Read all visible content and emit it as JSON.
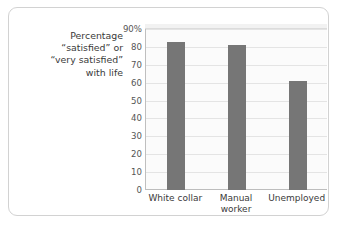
{
  "caption": {
    "lines": [
      "Percentage",
      "“satisfied” or",
      "“very satisfied”",
      "with life"
    ]
  },
  "colors": {
    "bar": "#767676",
    "gridline": "#e4e4e4",
    "axis": "#bfbfbf",
    "text": "#3a3a3a",
    "tick_text": "#555555",
    "frame_border": "#d2d2d2",
    "plot_background": "#fbfbfb"
  },
  "chart_data": {
    "type": "bar",
    "title": "",
    "subtitle": "",
    "xlabel": "",
    "ylabel": "Percentage “satisfied” or “very satisfied” with life",
    "categories": [
      "White collar",
      "Manual worker",
      "Unemployed"
    ],
    "category_lines": [
      [
        "White collar"
      ],
      [
        "Manual",
        "worker"
      ],
      [
        "Unemployed"
      ]
    ],
    "values": [
      83,
      81,
      61
    ],
    "ylim": [
      0,
      90
    ],
    "ytick_values": [
      0,
      10,
      20,
      30,
      40,
      50,
      60,
      70,
      80,
      90
    ],
    "ytick_labels": [
      "0",
      "10",
      "20",
      "30",
      "40",
      "50",
      "60",
      "70",
      "80",
      "90%"
    ],
    "grid": true,
    "legend": false,
    "legend_position": "none"
  }
}
